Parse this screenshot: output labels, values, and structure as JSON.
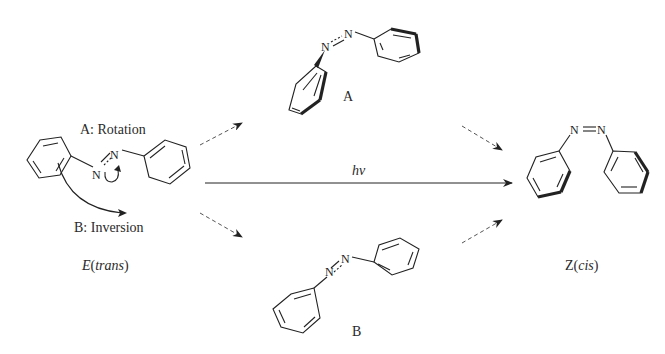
{
  "diagram": {
    "labels": {
      "rotation": "A: Rotation",
      "inversion": "B: Inversion",
      "intermediate_a": "A",
      "intermediate_b": "B",
      "light": "hν",
      "trans_prefix": "E",
      "trans_name": "trans",
      "cis_prefix": "Z",
      "cis_name": "cis"
    },
    "atoms": {
      "nitrogen": "N"
    },
    "colors": {
      "line": "#222222",
      "dashed_arrow": "#555555",
      "background": "#ffffff"
    },
    "nodes": [
      {
        "id": "E",
        "label": "E(trans)",
        "position": "left"
      },
      {
        "id": "A",
        "label": "A",
        "position": "top-center"
      },
      {
        "id": "B",
        "label": "B",
        "position": "bottom-center"
      },
      {
        "id": "Z",
        "label": "Z(cis)",
        "position": "right"
      }
    ],
    "edges": [
      {
        "from": "E",
        "to": "A",
        "style": "dashed"
      },
      {
        "from": "E",
        "to": "B",
        "style": "dashed"
      },
      {
        "from": "A",
        "to": "Z",
        "style": "dashed"
      },
      {
        "from": "B",
        "to": "Z",
        "style": "dashed"
      },
      {
        "from": "E",
        "to": "Z",
        "style": "solid",
        "label": "hν"
      }
    ]
  }
}
